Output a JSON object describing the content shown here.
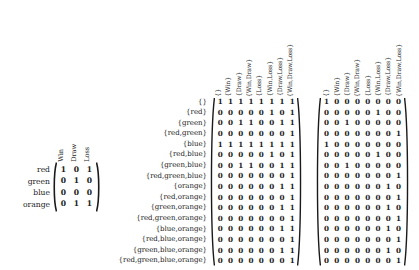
{
  "figure": {
    "kind": "matrix-triple",
    "background": "#ffffff",
    "ink": "#1a1a1a"
  },
  "chart_data": {
    "type": "table",
    "title": "",
    "matrices": [
      {
        "name": "left-matrix",
        "row_label_header": "",
        "col_headers": [
          "Win",
          "Draw",
          "Loss"
        ],
        "row_labels": [
          "red",
          "green",
          "blue",
          "orange"
        ],
        "values": [
          [
            1,
            0,
            1
          ],
          [
            0,
            1,
            0
          ],
          [
            0,
            0,
            0
          ],
          [
            0,
            1,
            1
          ]
        ],
        "delimiter": "parentheses"
      },
      {
        "name": "middle-matrix",
        "col_headers": [
          "{}",
          "{Win}",
          "{Draw}",
          "{Win,Draw}",
          "{Loss}",
          "{Win,Loss}",
          "{Draw,Loss}",
          "{Win,Draw,Loss}"
        ],
        "row_labels": [
          "{}",
          "{red}",
          "{green}",
          "{red,green}",
          "{blue}",
          "{red,blue}",
          "{green,blue}",
          "{red,green,blue}",
          "{orange}",
          "{red,orange}",
          "{green,orange}",
          "{red,green,orange}",
          "{blue,orange}",
          "{red,blue,orange}",
          "{green,blue,orange}",
          "{red,green,blue,orange}"
        ],
        "values": [
          [
            1,
            1,
            1,
            1,
            1,
            1,
            1,
            1
          ],
          [
            0,
            0,
            0,
            0,
            0,
            1,
            0,
            1
          ],
          [
            0,
            0,
            1,
            1,
            0,
            0,
            1,
            1
          ],
          [
            0,
            0,
            0,
            0,
            0,
            0,
            0,
            1
          ],
          [
            1,
            1,
            1,
            1,
            1,
            1,
            1,
            1
          ],
          [
            0,
            0,
            0,
            0,
            0,
            1,
            0,
            1
          ],
          [
            0,
            0,
            1,
            1,
            0,
            0,
            1,
            1
          ],
          [
            0,
            0,
            0,
            0,
            0,
            0,
            0,
            1
          ],
          [
            0,
            0,
            0,
            0,
            0,
            0,
            1,
            1
          ],
          [
            0,
            0,
            0,
            0,
            0,
            0,
            0,
            1
          ],
          [
            0,
            0,
            0,
            0,
            0,
            0,
            1,
            1
          ],
          [
            0,
            0,
            0,
            0,
            0,
            0,
            0,
            1
          ],
          [
            0,
            0,
            0,
            0,
            0,
            0,
            1,
            1
          ],
          [
            0,
            0,
            0,
            0,
            0,
            0,
            0,
            1
          ],
          [
            0,
            0,
            0,
            0,
            0,
            0,
            1,
            1
          ],
          [
            0,
            0,
            0,
            0,
            0,
            0,
            0,
            1
          ]
        ],
        "delimiter": "parentheses"
      },
      {
        "name": "right-matrix",
        "col_headers": [
          "{}",
          "{Win}",
          "{Draw}",
          "{Win,Draw}",
          "{Loss}",
          "{Win,Loss}",
          "{Draw,Loss}",
          "{Win,Draw,Loss}"
        ],
        "row_labels": [
          "{}",
          "{red}",
          "{green}",
          "{red,green}",
          "{blue}",
          "{red,blue}",
          "{green,blue}",
          "{red,green,blue}",
          "{orange}",
          "{red,orange}",
          "{green,orange}",
          "{red,green,orange}",
          "{blue,orange}",
          "{red,blue,orange}",
          "{green,blue,orange}",
          "{red,green,blue,orange}"
        ],
        "values": [
          [
            1,
            0,
            0,
            0,
            0,
            0,
            0,
            0
          ],
          [
            0,
            0,
            0,
            0,
            0,
            1,
            0,
            0
          ],
          [
            0,
            0,
            1,
            0,
            0,
            0,
            0,
            0
          ],
          [
            0,
            0,
            0,
            0,
            0,
            0,
            0,
            1
          ],
          [
            1,
            0,
            0,
            0,
            0,
            0,
            0,
            0
          ],
          [
            0,
            0,
            0,
            0,
            0,
            1,
            0,
            0
          ],
          [
            0,
            0,
            1,
            0,
            0,
            0,
            0,
            0
          ],
          [
            0,
            0,
            0,
            0,
            0,
            0,
            0,
            1
          ],
          [
            0,
            0,
            0,
            0,
            0,
            0,
            1,
            0
          ],
          [
            0,
            0,
            0,
            0,
            0,
            0,
            0,
            1
          ],
          [
            0,
            0,
            0,
            0,
            0,
            0,
            1,
            0
          ],
          [
            0,
            0,
            0,
            0,
            0,
            0,
            0,
            1
          ],
          [
            0,
            0,
            0,
            0,
            0,
            0,
            1,
            0
          ],
          [
            0,
            0,
            0,
            0,
            0,
            0,
            0,
            1
          ],
          [
            0,
            0,
            0,
            0,
            0,
            0,
            1,
            0
          ],
          [
            0,
            0,
            0,
            0,
            0,
            0,
            0,
            1
          ]
        ],
        "delimiter": "parentheses"
      }
    ]
  }
}
